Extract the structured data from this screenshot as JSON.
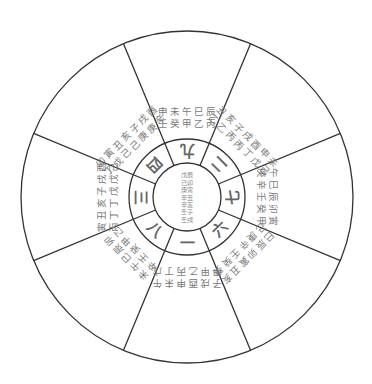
{
  "diagram": {
    "type": "nine-palace wheel",
    "stroke_color": "#333333",
    "text_color": "#7a7a7a",
    "center": {
      "items": [
        "戊辰",
        "己卯",
        "庚寅",
        "辛丑",
        "辛亥",
        "壬子",
        "壬戌"
      ]
    },
    "sectors": [
      {
        "position": "top",
        "number": "九",
        "angle": 0,
        "items": [
          "壬申",
          "癸未",
          "甲午",
          "乙巳",
          "丙辰"
        ]
      },
      {
        "position": "upper-right",
        "number": "二",
        "angle": 45,
        "items": [
          "乙丑",
          "乙亥",
          "丙子",
          "丙戌",
          "丁酉",
          "戊申",
          "己未"
        ]
      },
      {
        "position": "right",
        "number": "七",
        "angle": 90,
        "items": [
          "庚午",
          "辛巳",
          "壬辰",
          "癸卯",
          "甲寅"
        ]
      },
      {
        "position": "lower-right",
        "number": "六",
        "angle": 135,
        "items": [
          "己巳",
          "庚辰",
          "辛卯",
          "壬寅",
          "癸丑",
          "癸亥"
        ]
      },
      {
        "position": "bottom",
        "number": "一",
        "angle": 180,
        "items": [
          "甲子",
          "甲戌",
          "乙酉",
          "丙申",
          "丁未",
          "戊午"
        ]
      },
      {
        "position": "lower-left",
        "number": "八",
        "angle": 225,
        "items": [
          "辛未",
          "壬午",
          "癸巳",
          "甲辰",
          "乙卯"
        ]
      },
      {
        "position": "left",
        "number": "三",
        "angle": 270,
        "items": [
          "丙寅",
          "丁丑",
          "丁亥",
          "戊子",
          "戊戌",
          "己酉"
        ]
      },
      {
        "position": "upper-left",
        "number": "四",
        "angle": 315,
        "items": [
          "丁卯",
          "戊寅",
          "己丑",
          "己亥",
          "庚子",
          "庚戌",
          "辛酉"
        ]
      }
    ]
  }
}
